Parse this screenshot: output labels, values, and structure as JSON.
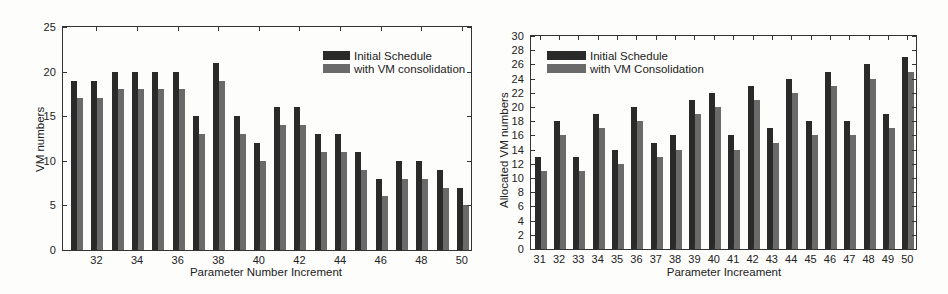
{
  "colors": {
    "initial": "#2a2a2a",
    "consolidated": "#6a6a6a",
    "axis": "#333333"
  },
  "chart_data": [
    {
      "type": "bar",
      "title": "",
      "xlabel": "Parameter Number Increment",
      "ylabel": "VM numbers",
      "ylim": [
        0,
        25
      ],
      "yticks": [
        0,
        5,
        10,
        15,
        20,
        25
      ],
      "x": [
        31,
        32,
        33,
        34,
        35,
        36,
        37,
        38,
        39,
        40,
        41,
        42,
        43,
        44,
        45,
        46,
        47,
        48,
        49,
        50
      ],
      "xtick_labels": [
        "32",
        "34",
        "36",
        "38",
        "40",
        "42",
        "44",
        "46",
        "48",
        "50"
      ],
      "legend_position": "upper right",
      "grid": false,
      "series": [
        {
          "name": "Initial Schedule",
          "values": [
            19,
            19,
            20,
            20,
            20,
            20,
            15,
            21,
            15,
            12,
            16,
            16,
            13,
            13,
            11,
            8,
            10,
            10,
            9,
            7
          ]
        },
        {
          "name": "with VM consolidation",
          "values": [
            17,
            17,
            18,
            18,
            18,
            18,
            13,
            19,
            13,
            10,
            14,
            14,
            11,
            11,
            9,
            6,
            8,
            8,
            7,
            5
          ]
        }
      ]
    },
    {
      "type": "bar",
      "title": "",
      "xlabel": "Parameter Increament",
      "ylabel": "Allocated VM numbers",
      "ylim": [
        0,
        30
      ],
      "yticks": [
        0,
        2,
        4,
        6,
        8,
        10,
        12,
        14,
        16,
        18,
        20,
        22,
        24,
        26,
        28,
        30
      ],
      "x": [
        31,
        32,
        33,
        34,
        35,
        36,
        37,
        38,
        39,
        40,
        41,
        42,
        43,
        44,
        45,
        46,
        47,
        48,
        49,
        50
      ],
      "xtick_labels": [
        "31",
        "32",
        "33",
        "34",
        "35",
        "36",
        "37",
        "38",
        "39",
        "40",
        "41",
        "42",
        "43",
        "44",
        "45",
        "46",
        "47",
        "48",
        "49",
        "50"
      ],
      "legend_position": "upper left",
      "grid": false,
      "series": [
        {
          "name": "Initial Schedule",
          "values": [
            13,
            18,
            13,
            19,
            14,
            20,
            15,
            16,
            21,
            22,
            16,
            23,
            17,
            24,
            18,
            25,
            18,
            26,
            19,
            27
          ]
        },
        {
          "name": "with VM Consolidation",
          "values": [
            11,
            16,
            11,
            17,
            12,
            18,
            13,
            14,
            19,
            20,
            14,
            21,
            15,
            22,
            16,
            23,
            16,
            24,
            17,
            25
          ]
        }
      ]
    }
  ],
  "left": {
    "xlabel": "Parameter Number Increment",
    "ylabel": "VM numbers",
    "legend": [
      "Initial Schedule",
      "with VM consolidation"
    ]
  },
  "right": {
    "xlabel": "Parameter Increament",
    "ylabel": "Allocated VM numbers",
    "legend": [
      "Initial Schedule",
      "with VM Consolidation"
    ]
  }
}
